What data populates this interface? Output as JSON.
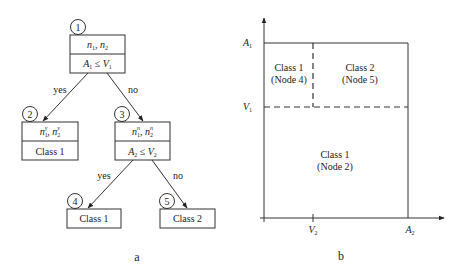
{
  "panel_a": {
    "caption": "a",
    "nodes": [
      {
        "id": "1",
        "top": "n1, n2",
        "bottom": "A1 ≤ V1"
      },
      {
        "id": "2",
        "top": "n1y, n2y",
        "bottom": "Class 1"
      },
      {
        "id": "3",
        "top": "n1n, n2n",
        "bottom": "A2 ≤ V2"
      },
      {
        "id": "4",
        "label": "Class 1"
      },
      {
        "id": "5",
        "label": "Class 2"
      }
    ],
    "edges": [
      {
        "from": "1",
        "to": "2",
        "label": "yes"
      },
      {
        "from": "1",
        "to": "3",
        "label": "no"
      },
      {
        "from": "3",
        "to": "4",
        "label": "yes"
      },
      {
        "from": "3",
        "to": "5",
        "label": "no"
      }
    ]
  },
  "panel_b": {
    "caption": "b",
    "y_ticks": {
      "top": "A",
      "top_sub": "1",
      "mid": "V",
      "mid_sub": "1"
    },
    "x_ticks": {
      "mid": "V",
      "mid_sub": "2",
      "right": "A",
      "right_sub": "2"
    },
    "regions": [
      {
        "line1": "Class 1",
        "line2": "(Node 4)"
      },
      {
        "line1": "Class 2",
        "line2": "(Node 5)"
      },
      {
        "line1": "Class 1",
        "line2": "(Node 2)"
      }
    ]
  },
  "symbols": {
    "n": "n",
    "A": "A",
    "V": "V",
    "sub1": "1",
    "sub2": "2",
    "sup_yes": "y",
    "sup_no": "n",
    "leq": "≤",
    "comma": ","
  }
}
